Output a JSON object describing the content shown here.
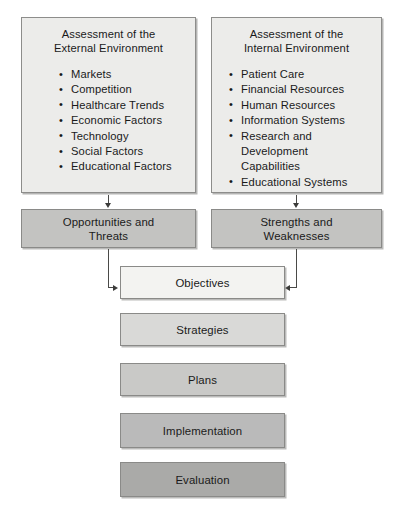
{
  "diagram": {
    "assessment_boxes": [
      {
        "id": "external",
        "title": "Assessment of the\nExternal Environment",
        "items": [
          "Markets",
          "Competition",
          "Healthcare Trends",
          "Economic Factors",
          "Technology",
          "Social Factors",
          "Educational Factors"
        ]
      },
      {
        "id": "internal",
        "title": "Assessment of the\nInternal Environment",
        "items": [
          "Patient Care",
          "Financial Resources",
          "Human Resources",
          "Information Systems",
          "Research and Development",
          "Educational Systems"
        ],
        "item5_continuation": "Capabilities"
      }
    ],
    "outcome_boxes": [
      {
        "id": "opportunities",
        "label": "Opportunities and\nThreats",
        "fill": "#c3c3c1"
      },
      {
        "id": "strengths",
        "label": "Strengths and\nWeaknesses",
        "fill": "#c3c3c1"
      }
    ],
    "cascade_boxes": [
      {
        "id": "objectives",
        "label": "Objectives",
        "fill": "#f3f3f1"
      },
      {
        "id": "strategies",
        "label": "Strategies",
        "fill": "#d9d9d7"
      },
      {
        "id": "plans",
        "label": "Plans",
        "fill": "#c9c9c7"
      },
      {
        "id": "implementation",
        "label": "Implementation",
        "fill": "#bababa"
      },
      {
        "id": "evaluation",
        "label": "Evaluation",
        "fill": "#aaaaa8"
      }
    ],
    "colors": {
      "assessment_fill": "#ececea",
      "border": "#8a8a88",
      "text": "#1a1a1a",
      "connector": "#4a4a48",
      "background": "#ffffff"
    }
  }
}
